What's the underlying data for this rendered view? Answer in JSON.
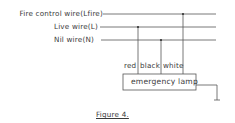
{
  "wires": [
    {
      "label": "Fire control wire(Lfire)",
      "y": 14
    },
    {
      "label": "Live wire(L)",
      "y": 27
    },
    {
      "label": "Nil wire(N)",
      "y": 40
    }
  ],
  "lamp": {
    "label": "emergency lamp",
    "terminals": [
      "red",
      "black",
      "white"
    ]
  },
  "caption": "Figure 4.",
  "colors": {
    "line": "#555555",
    "text": "#3a3a3a"
  }
}
